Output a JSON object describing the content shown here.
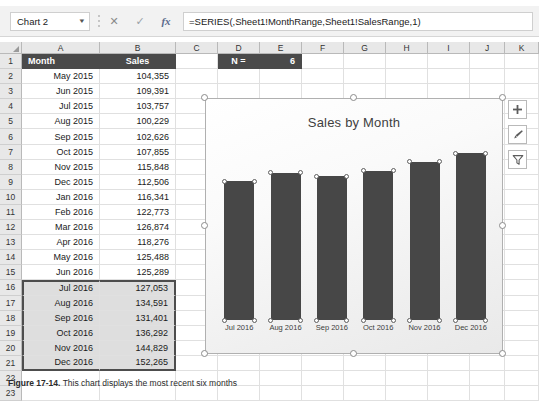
{
  "formula_bar": {
    "name_box_value": "Chart 2",
    "caret_icon": "chevron-down-icon",
    "cancel_icon": "✕",
    "confirm_icon": "✓",
    "function_icon": "fx",
    "formula": "=SERIES(,Sheet1!MonthRange,Sheet1!SalesRange,1)"
  },
  "grid": {
    "column_headers": [
      "A",
      "B",
      "C",
      "D",
      "E",
      "F",
      "G",
      "H",
      "I",
      "J",
      "K"
    ],
    "row_numbers": [
      "1",
      "2",
      "3",
      "4",
      "5",
      "6",
      "7",
      "8",
      "9",
      "10",
      "11",
      "12",
      "13",
      "14",
      "15",
      "16",
      "17",
      "18",
      "19",
      "20",
      "21",
      "22",
      "23"
    ],
    "headers": {
      "month": "Month",
      "sales": "Sales",
      "n_label": "N =",
      "n_value": "6"
    },
    "rows": [
      {
        "row": "2",
        "month": "May 2015",
        "sales": "104,355",
        "selected": false
      },
      {
        "row": "3",
        "month": "Jun 2015",
        "sales": "109,391",
        "selected": false
      },
      {
        "row": "4",
        "month": "Jul 2015",
        "sales": "103,757",
        "selected": false
      },
      {
        "row": "5",
        "month": "Aug 2015",
        "sales": "100,229",
        "selected": false
      },
      {
        "row": "6",
        "month": "Sep 2015",
        "sales": "102,626",
        "selected": false
      },
      {
        "row": "7",
        "month": "Oct 2015",
        "sales": "107,855",
        "selected": false
      },
      {
        "row": "8",
        "month": "Nov 2015",
        "sales": "115,848",
        "selected": false
      },
      {
        "row": "9",
        "month": "Dec 2015",
        "sales": "112,506",
        "selected": false
      },
      {
        "row": "10",
        "month": "Jan 2016",
        "sales": "116,341",
        "selected": false
      },
      {
        "row": "11",
        "month": "Feb 2016",
        "sales": "122,773",
        "selected": false
      },
      {
        "row": "12",
        "month": "Mar 2016",
        "sales": "126,874",
        "selected": false
      },
      {
        "row": "13",
        "month": "Apr 2016",
        "sales": "118,276",
        "selected": false
      },
      {
        "row": "14",
        "month": "May 2016",
        "sales": "125,488",
        "selected": false
      },
      {
        "row": "15",
        "month": "Jun 2016",
        "sales": "125,289",
        "selected": false
      },
      {
        "row": "16",
        "month": "Jul 2016",
        "sales": "127,053",
        "selected": true
      },
      {
        "row": "17",
        "month": "Aug 2016",
        "sales": "134,591",
        "selected": true
      },
      {
        "row": "18",
        "month": "Sep 2016",
        "sales": "131,401",
        "selected": true
      },
      {
        "row": "19",
        "month": "Oct 2016",
        "sales": "136,292",
        "selected": true
      },
      {
        "row": "20",
        "month": "Nov 2016",
        "sales": "144,829",
        "selected": true
      },
      {
        "row": "21",
        "month": "Dec 2016",
        "sales": "152,265",
        "selected": true
      },
      {
        "row": "22",
        "month": "",
        "sales": "",
        "selected": false
      },
      {
        "row": "23",
        "month": "",
        "sales": "",
        "selected": false
      }
    ]
  },
  "chart": {
    "title": "Sales by Month",
    "selected": true,
    "buttons": [
      {
        "name": "chart-elements-button",
        "icon": "plus-icon"
      },
      {
        "name": "chart-styles-button",
        "icon": "brush-icon"
      },
      {
        "name": "chart-filters-button",
        "icon": "funnel-icon"
      }
    ]
  },
  "chart_data": {
    "type": "bar",
    "title": "Sales by Month",
    "categories": [
      "Jul 2016",
      "Aug 2016",
      "Sep 2016",
      "Oct 2016",
      "Nov 2016",
      "Dec 2016"
    ],
    "values": [
      127053,
      134591,
      131401,
      136292,
      144829,
      152265
    ],
    "series": [
      {
        "name": "Sales",
        "values": [
          127053,
          134591,
          131401,
          136292,
          144829,
          152265
        ]
      }
    ],
    "xlabel": "",
    "ylabel": "",
    "ylim": [
      0,
      160000
    ],
    "grid": false,
    "legend": "none",
    "value_axis_visible": false,
    "bar_color": "#474747"
  },
  "caption": {
    "figure": "Figure 17-14.",
    "text": "This chart displays the most recent six months"
  }
}
